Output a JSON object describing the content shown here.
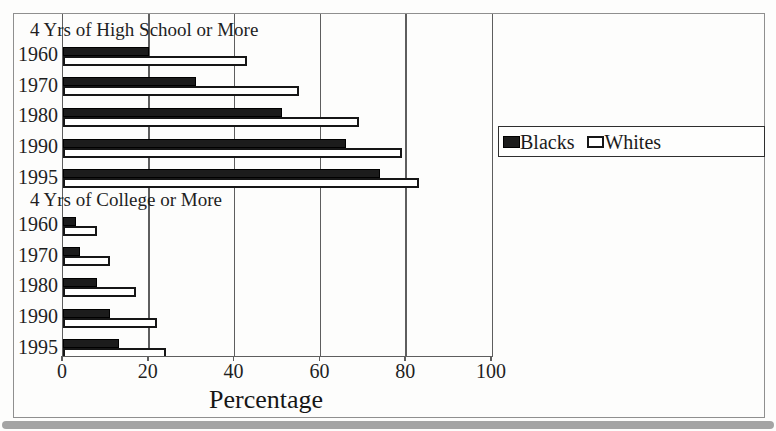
{
  "chart_data": {
    "type": "bar",
    "orientation": "horizontal",
    "title": "",
    "xlabel": "Percentage",
    "xlim": [
      0,
      100
    ],
    "x_ticks": [
      0,
      20,
      40,
      60,
      80,
      100
    ],
    "gridlines": [
      20,
      40,
      60,
      80
    ],
    "grid": true,
    "legend_position": "right",
    "series_names": [
      "Blacks",
      "Whites"
    ],
    "sections": [
      {
        "header": "4 Yrs of High School or More",
        "categories": [
          "1960",
          "1970",
          "1980",
          "1990",
          "1995"
        ],
        "series": [
          {
            "name": "Blacks",
            "values": [
              20,
              31,
              51,
              66,
              74
            ]
          },
          {
            "name": "Whites",
            "values": [
              43,
              55,
              69,
              79,
              83
            ]
          }
        ]
      },
      {
        "header": "4 Yrs of College or More",
        "categories": [
          "1960",
          "1970",
          "1980",
          "1990",
          "1995"
        ],
        "series": [
          {
            "name": "Blacks",
            "values": [
              3,
              4,
              8,
              11,
              13
            ]
          },
          {
            "name": "Whites",
            "values": [
              8,
              11,
              17,
              22,
              24
            ]
          }
        ]
      }
    ],
    "colors": {
      "blacks_bar": "#1c1c1c",
      "whites_bar": "#ffffff",
      "bar_border": "#161616"
    }
  },
  "legend": {
    "items": [
      {
        "label": "Blacks",
        "swatch": "filled-black-square"
      },
      {
        "label": "Whites",
        "swatch": "outlined-white-square"
      }
    ]
  },
  "axis": {
    "tick_labels": [
      "0",
      "20",
      "40",
      "60",
      "80",
      "100"
    ],
    "title": "Percentage"
  }
}
